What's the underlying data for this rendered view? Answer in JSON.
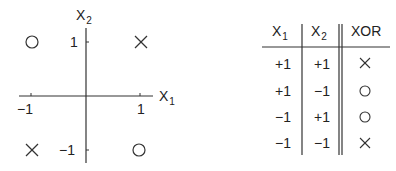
{
  "plot": {
    "x_axis_label": "X",
    "x_axis_sub": "1",
    "y_axis_label": "X",
    "y_axis_sub": "2",
    "x_ticks": [
      "−1",
      "1"
    ],
    "y_ticks": [
      "1",
      "−1"
    ],
    "points": [
      {
        "x1": -1,
        "x2": 1,
        "marker": "circle"
      },
      {
        "x1": 1,
        "x2": 1,
        "marker": "cross"
      },
      {
        "x1": -1,
        "x2": -1,
        "marker": "cross"
      },
      {
        "x1": 1,
        "x2": -1,
        "marker": "circle"
      }
    ]
  },
  "table": {
    "headers": [
      {
        "label": "X",
        "sub": "1"
      },
      {
        "label": "X",
        "sub": "2"
      },
      {
        "label": "XOR",
        "sub": ""
      }
    ],
    "rows": [
      {
        "x1": "+1",
        "x2": "+1",
        "xor": "cross"
      },
      {
        "x1": "+1",
        "x2": "−1",
        "xor": "circle"
      },
      {
        "x1": "−1",
        "x2": "+1",
        "xor": "circle"
      },
      {
        "x1": "−1",
        "x2": "−1",
        "xor": "cross"
      }
    ]
  }
}
